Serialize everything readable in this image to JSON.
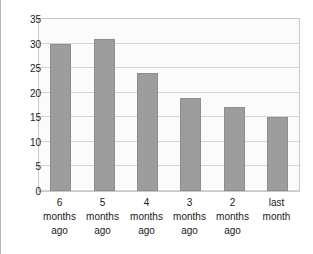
{
  "caption": {
    "text": "Table below: No. of visits / contacts each month"
  },
  "chart_data": {
    "type": "bar",
    "title": "",
    "xlabel": "",
    "ylabel": "",
    "categories": [
      "6 months ago",
      "5 months ago",
      "4 months ago",
      "3 months ago",
      "2 months ago",
      "last month"
    ],
    "category_lines": [
      [
        "6",
        "months",
        "ago"
      ],
      [
        "5",
        "months",
        "ago"
      ],
      [
        "4",
        "months",
        "ago"
      ],
      [
        "3",
        "months",
        "ago"
      ],
      [
        "2",
        "months",
        "ago"
      ],
      [
        "last",
        "month",
        ""
      ]
    ],
    "values": [
      30,
      31,
      24,
      19,
      17,
      15
    ],
    "ylim": [
      0,
      35
    ],
    "ytick_step": 5,
    "yticks": [
      35,
      30,
      25,
      20,
      15,
      10,
      5,
      0
    ],
    "grid": true,
    "legend": false,
    "bar_color": "#9d9d9d",
    "bar_border_color": "#8d8d8d",
    "gridline_color": "#d4d4d4",
    "plot_background": "#fbfbfb",
    "plot_border_color": "#c9c9c9",
    "text_color": "#1a1a1a"
  }
}
